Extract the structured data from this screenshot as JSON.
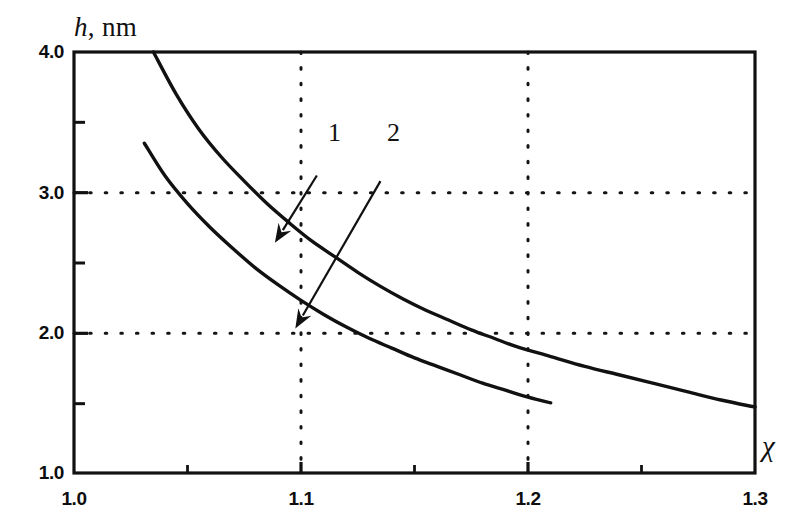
{
  "chart_data": {
    "type": "line",
    "title": "",
    "xlabel": "χ",
    "ylabel": "h, nm",
    "ylabel_italic_part": "h",
    "ylabel_rest": ", nm",
    "xlim": [
      1.0,
      1.3
    ],
    "ylim": [
      1.0,
      4.0
    ],
    "grid": true,
    "grid_style": "dotted",
    "x_gridlines": [
      1.1,
      1.2
    ],
    "y_gridlines": [
      2.0,
      3.0
    ],
    "xticks_major": [
      1.0,
      1.1,
      1.2,
      1.3
    ],
    "xticks_minor": [
      1.05,
      1.15,
      1.25
    ],
    "yticks_major": [
      1.0,
      2.0,
      3.0,
      4.0
    ],
    "yticks_minor": [
      1.5,
      2.5,
      3.5
    ],
    "xtick_labels": [
      "1.0",
      "1.1",
      "1.2",
      "1.3"
    ],
    "ytick_labels": [
      "1.0",
      "2.0",
      "3.0",
      "4.0"
    ],
    "legend_position": "inline-annotations",
    "series": [
      {
        "name": "1",
        "label": "1",
        "points": [
          [
            1.035,
            4.0
          ],
          [
            1.045,
            3.7
          ],
          [
            1.055,
            3.45
          ],
          [
            1.065,
            3.25
          ],
          [
            1.075,
            3.08
          ],
          [
            1.085,
            2.92
          ],
          [
            1.095,
            2.78
          ],
          [
            1.105,
            2.65
          ],
          [
            1.115,
            2.54
          ],
          [
            1.125,
            2.43
          ],
          [
            1.135,
            2.33
          ],
          [
            1.145,
            2.24
          ],
          [
            1.155,
            2.16
          ],
          [
            1.165,
            2.09
          ],
          [
            1.175,
            2.02
          ],
          [
            1.185,
            1.96
          ],
          [
            1.195,
            1.9
          ],
          [
            1.21,
            1.83
          ],
          [
            1.225,
            1.76
          ],
          [
            1.24,
            1.7
          ],
          [
            1.255,
            1.64
          ],
          [
            1.27,
            1.58
          ],
          [
            1.285,
            1.52
          ],
          [
            1.3,
            1.47
          ]
        ]
      },
      {
        "name": "2",
        "label": "2",
        "points": [
          [
            1.031,
            3.35
          ],
          [
            1.04,
            3.12
          ],
          [
            1.05,
            2.92
          ],
          [
            1.06,
            2.75
          ],
          [
            1.07,
            2.6
          ],
          [
            1.08,
            2.46
          ],
          [
            1.09,
            2.34
          ],
          [
            1.1,
            2.23
          ],
          [
            1.11,
            2.13
          ],
          [
            1.12,
            2.04
          ],
          [
            1.13,
            1.96
          ],
          [
            1.14,
            1.89
          ],
          [
            1.15,
            1.82
          ],
          [
            1.16,
            1.76
          ],
          [
            1.17,
            1.7
          ],
          [
            1.18,
            1.64
          ],
          [
            1.19,
            1.59
          ],
          [
            1.2,
            1.54
          ],
          [
            1.21,
            1.5
          ]
        ]
      }
    ],
    "annotations": [
      {
        "label": "1",
        "text_x": 1.115,
        "text_y": 3.28,
        "arrow_from": [
          1.107,
          3.12
        ],
        "arrow_to": [
          1.0885,
          2.64
        ],
        "target_series": "1"
      },
      {
        "label": "2",
        "text_x": 1.141,
        "text_y": 3.28,
        "arrow_from": [
          1.135,
          3.08
        ],
        "arrow_to": [
          1.0975,
          2.03
        ],
        "target_series": "2"
      }
    ]
  },
  "axes": {
    "y_title_italic": "h",
    "y_title_rest": ", nm",
    "x_title": "χ"
  },
  "ticks": {
    "y": [
      {
        "value": "4.0"
      },
      {
        "value": "3.0"
      },
      {
        "value": "2.0"
      },
      {
        "value": "1.0"
      }
    ],
    "x": [
      {
        "value": "1.0"
      },
      {
        "value": "1.1"
      },
      {
        "value": "1.2"
      },
      {
        "value": "1.3"
      }
    ]
  },
  "curve_labels": [
    {
      "text": "1"
    },
    {
      "text": "2"
    }
  ],
  "colors": {
    "ink": "#111111",
    "background": "#ffffff",
    "grid": "#1a1a1a"
  }
}
